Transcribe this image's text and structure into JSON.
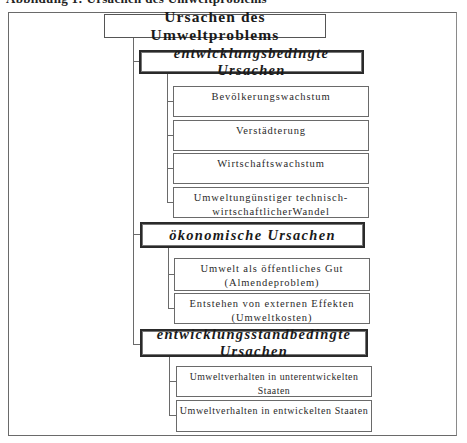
{
  "header": {
    "cutoff_caption": "Abbildung 1: Ursachen des Umweltproblems"
  },
  "diagram": {
    "root": "Ursachen des Umweltproblems",
    "categories": [
      {
        "label": "entwicklungsbedingte Ursachen",
        "items": [
          {
            "line1": "Bevölkerungswachstum",
            "line2": ""
          },
          {
            "line1": "Verstädterung",
            "line2": ""
          },
          {
            "line1": "Wirtschaftswachstum",
            "line2": ""
          },
          {
            "line1": "Umweltungünstiger technisch-",
            "line2": "wirtschaftlicherWandel"
          }
        ]
      },
      {
        "label": "ökonomische Ursachen",
        "items": [
          {
            "line1": "Umwelt als öffentliches Gut",
            "line2": "(Almendeproblem)"
          },
          {
            "line1": "Entstehen von externen Effekten",
            "line2": "(Umweltkosten)"
          }
        ]
      },
      {
        "label": "entwicklungsstandbedingte Ursachen",
        "items": [
          {
            "line1": "Umweltverhalten in unterentwickelten Staaten",
            "line2": ""
          },
          {
            "line1": "Umweltverhalten in entwickelten Staaten",
            "line2": ""
          }
        ]
      }
    ]
  }
}
